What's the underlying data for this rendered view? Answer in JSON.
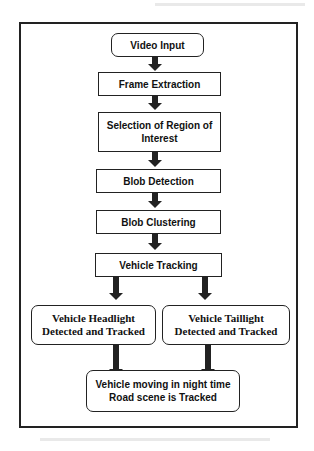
{
  "diagram": {
    "type": "flowchart",
    "nodes": [
      {
        "id": "video_input",
        "label": "Video Input",
        "shape": "rounded"
      },
      {
        "id": "frame_extraction",
        "label": "Frame Extraction",
        "shape": "rect"
      },
      {
        "id": "roi_selection",
        "label": "Selection of Region of Interest",
        "shape": "rect"
      },
      {
        "id": "blob_detection",
        "label": "Blob Detection",
        "shape": "rect"
      },
      {
        "id": "blob_clustering",
        "label": "Blob Clustering",
        "shape": "rect"
      },
      {
        "id": "vehicle_tracking",
        "label": "Vehicle Tracking",
        "shape": "rect"
      },
      {
        "id": "headlight",
        "label": "Vehicle Headlight Detected and Tracked",
        "shape": "rounded"
      },
      {
        "id": "taillight",
        "label": "Vehicle Taillight Detected and Tracked",
        "shape": "rounded"
      },
      {
        "id": "final",
        "label": "Vehicle moving in night time Road scene is Tracked",
        "shape": "rounded"
      }
    ],
    "edges": [
      [
        "video_input",
        "frame_extraction"
      ],
      [
        "frame_extraction",
        "roi_selection"
      ],
      [
        "roi_selection",
        "blob_detection"
      ],
      [
        "blob_detection",
        "blob_clustering"
      ],
      [
        "blob_clustering",
        "vehicle_tracking"
      ],
      [
        "vehicle_tracking",
        "headlight"
      ],
      [
        "vehicle_tracking",
        "taillight"
      ],
      [
        "headlight",
        "final"
      ],
      [
        "taillight",
        "final"
      ]
    ]
  },
  "labels": {
    "video_input": "Video Input",
    "frame_extraction": "Frame Extraction",
    "roi_line1": "Selection of Region of",
    "roi_line2": "Interest",
    "blob_detection": "Blob Detection",
    "blob_clustering": "Blob Clustering",
    "vehicle_tracking": "Vehicle Tracking",
    "headlight_line1": "Vehicle Headlight",
    "headlight_line2": "Detected and Tracked",
    "taillight_line1": "Vehicle Taillight",
    "taillight_line2": "Detected and Tracked",
    "final_line1": "Vehicle moving in night time",
    "final_line2": "Road scene is Tracked"
  }
}
